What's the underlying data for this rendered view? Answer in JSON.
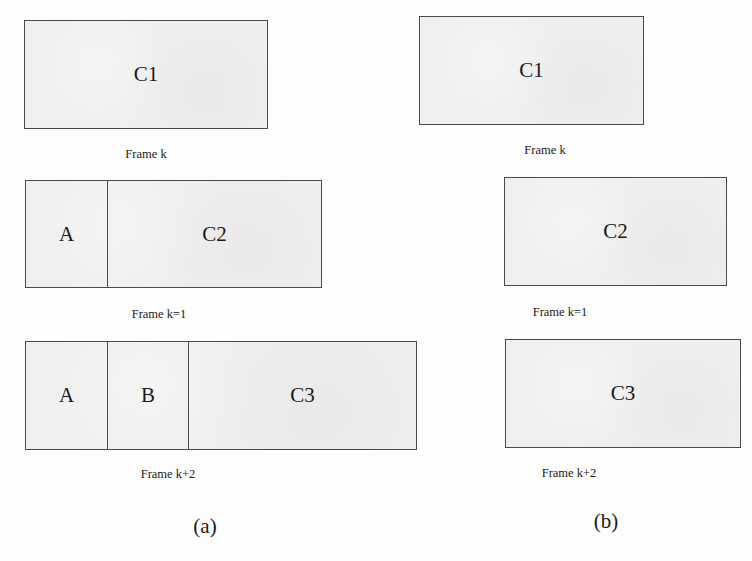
{
  "figure": {
    "panels": [
      {
        "id": "a",
        "caption": "(a)",
        "frames": [
          {
            "label": "Frame k",
            "cells": [
              "C1"
            ]
          },
          {
            "label": "Frame k=1",
            "cells": [
              "A",
              "C2"
            ]
          },
          {
            "label": "Frame k+2",
            "cells": [
              "A",
              "B",
              "C3"
            ]
          }
        ]
      },
      {
        "id": "b",
        "caption": "(b)",
        "frames": [
          {
            "label": "Frame k",
            "cells": [
              "C1"
            ]
          },
          {
            "label": "Frame k=1",
            "cells": [
              "C2"
            ]
          },
          {
            "label": "Frame k+2",
            "cells": [
              "C3"
            ]
          }
        ]
      }
    ]
  },
  "colors": {
    "box_fill": "#efefef",
    "box_border": "#4a4a4a",
    "text": "#1a1a1a"
  }
}
